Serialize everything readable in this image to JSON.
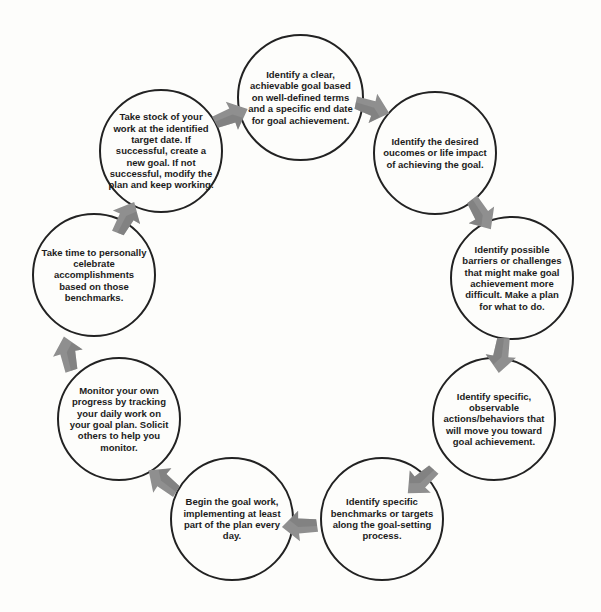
{
  "diagram": {
    "type": "cycle",
    "background_color": "#fdfdfb",
    "circle_border_color": "#222222",
    "text_color": "#1c1c1c",
    "arrow_color": "#8f8f8f",
    "arrow_shade_color": "#787878",
    "nodes": [
      {
        "id": "define-goal",
        "text": "Identify a clear, achievable goal based on well-defined terms and a specific end date for goal achievement."
      },
      {
        "id": "desired-outcomes",
        "text": "Identify the desired oucomes or life impact of achieving the goal."
      },
      {
        "id": "barriers",
        "text": "Identify possible barriers or challenges that might make goal achievement more difficult. Make a plan for what to do."
      },
      {
        "id": "actions",
        "text": "Identify specific, observable actions/behaviors that will move you toward goal achievement."
      },
      {
        "id": "benchmarks",
        "text": "Identify specific benchmarks or targets along the goal-setting process."
      },
      {
        "id": "begin-work",
        "text": "Begin the goal work, implementing at least part of the plan every day."
      },
      {
        "id": "monitor",
        "text": "Monitor your own progress by tracking your daily work on your goal plan. Solicit others to help you monitor."
      },
      {
        "id": "celebrate",
        "text": "Take time to personally celebrate accomplishments based on those benchmarks."
      },
      {
        "id": "take-stock",
        "text": "Take stock of your work at the identified target date. If successful, create a new goal. If not successful, modify the plan and keep working."
      }
    ],
    "arrows": [
      {
        "from": "define-goal",
        "to": "desired-outcomes",
        "direction": "down-right"
      },
      {
        "from": "desired-outcomes",
        "to": "barriers",
        "direction": "down"
      },
      {
        "from": "barriers",
        "to": "actions",
        "direction": "down"
      },
      {
        "from": "actions",
        "to": "benchmarks",
        "direction": "down-left"
      },
      {
        "from": "benchmarks",
        "to": "begin-work",
        "direction": "left"
      },
      {
        "from": "begin-work",
        "to": "monitor",
        "direction": "up-left"
      },
      {
        "from": "monitor",
        "to": "celebrate",
        "direction": "up"
      },
      {
        "from": "celebrate",
        "to": "take-stock",
        "direction": "up-right"
      },
      {
        "from": "take-stock",
        "to": "define-goal",
        "direction": "right"
      }
    ]
  }
}
